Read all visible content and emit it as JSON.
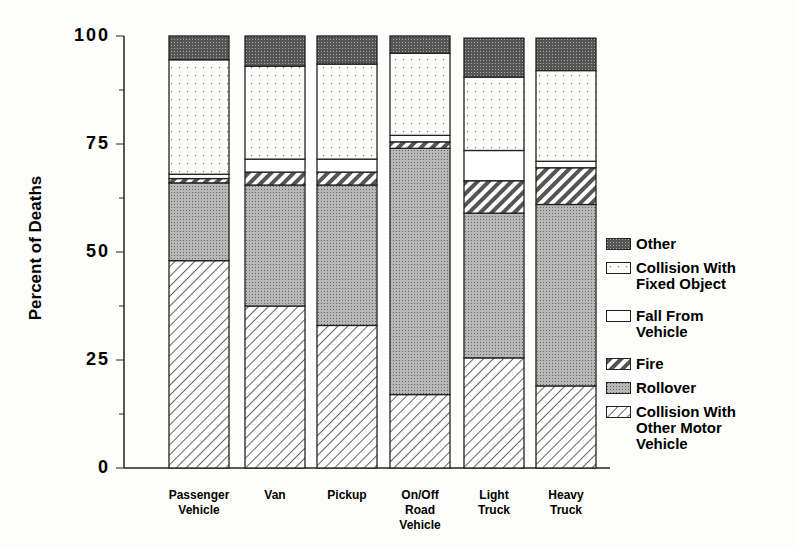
{
  "chart_data": {
    "type": "bar",
    "stacked": true,
    "title": "",
    "xlabel": "",
    "ylabel": "Percent of Deaths",
    "ylim": [
      0,
      100
    ],
    "yticks": [
      0,
      25,
      50,
      75,
      100
    ],
    "categories": [
      "Passenger\nVehicle",
      "Van",
      "Pickup",
      "On/Off\nRoad\nVehicle",
      "Light\nTruck",
      "Heavy\nTruck"
    ],
    "series": [
      {
        "name": "Collision With Other Motor Vehicle",
        "values": [
          48,
          37.5,
          33,
          17,
          25.5,
          19
        ]
      },
      {
        "name": "Rollover",
        "values": [
          18,
          28,
          32.5,
          57,
          33.5,
          42
        ]
      },
      {
        "name": "Fire",
        "values": [
          1,
          3,
          3,
          1.5,
          7.5,
          8.5
        ]
      },
      {
        "name": "Fall From Vehicle",
        "values": [
          1,
          3,
          3,
          1.5,
          7,
          1.5
        ]
      },
      {
        "name": "Collision With Fixed Object",
        "values": [
          26.5,
          21.5,
          22,
          19,
          17,
          21
        ]
      },
      {
        "name": "Other",
        "values": [
          5.5,
          7,
          6.5,
          4,
          9,
          7.5
        ]
      }
    ],
    "legend": [
      "Other",
      "Collision With\nFixed Object",
      "Fall From\nVehicle",
      "Fire",
      "Rollover",
      "Collision With\nOther Motor\nVehicle"
    ],
    "legend_position": "right",
    "grid": false
  }
}
